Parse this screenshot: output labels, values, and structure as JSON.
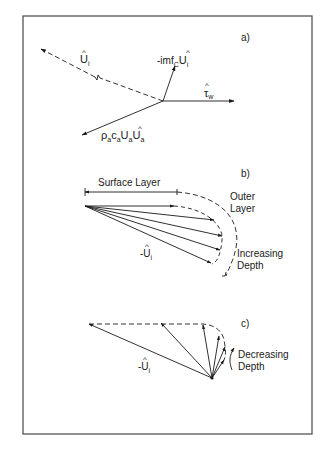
{
  "figure": {
    "panels": [
      {
        "id": "a",
        "label": "a)",
        "vectors": [
          {
            "name": "ice-velocity",
            "label_main": "U",
            "label_sub": "i",
            "hat": "^",
            "style": "dashed"
          },
          {
            "name": "coriolis",
            "label_prefix": "-imf",
            "label_sub_c": "C",
            "label_main": "U",
            "label_sub": "i",
            "hat": "^",
            "style": "solid"
          },
          {
            "name": "wind-stress",
            "label_main": "τ",
            "label_sub": "w",
            "hat": "^",
            "style": "solid"
          },
          {
            "name": "air-drag",
            "label_text": "ρ",
            "label_sub1": "a",
            "label_c": "c",
            "label_sub2": "a",
            "label_U": "U",
            "label_sub3": "a",
            "label_U2": "U",
            "label_sub4": "a",
            "hat": "^",
            "style": "solid"
          }
        ]
      },
      {
        "id": "b",
        "label": "b)",
        "surface_layer_label": "Surface Layer",
        "outer_layer_label_line1": "Outer",
        "outer_layer_label_line2": "Layer",
        "depth_label_line1": "Increasing",
        "depth_label_line2": "Depth",
        "vector_label_prefix": "-",
        "vector_label_main": "U",
        "vector_label_sub": "i",
        "hat": "^"
      },
      {
        "id": "c",
        "label": "c)",
        "depth_label_line1": "Decreasing",
        "depth_label_line2": "Depth",
        "vector_label_prefix": "-",
        "vector_label_main": "U",
        "vector_label_sub": "i",
        "hat": "^"
      }
    ]
  },
  "colors": {
    "line": "#1a1a1a",
    "frame": "#555555",
    "background": "#ffffff"
  }
}
